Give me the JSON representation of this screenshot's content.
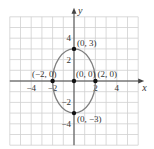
{
  "chart_data": {
    "type": "scatter",
    "title": "",
    "xlabel": "x",
    "ylabel": "y",
    "xlim": [
      -6,
      6
    ],
    "ylim": [
      -6,
      6
    ],
    "grid": true,
    "x_ticks": [
      -4,
      -2,
      2,
      4
    ],
    "y_ticks": [
      -4,
      -2,
      2,
      4
    ],
    "x_tick_labels": [
      "−4",
      "−2",
      "2",
      "4"
    ],
    "y_tick_labels": [
      "−4",
      "−2",
      "2",
      "4"
    ],
    "curve": {
      "shape": "ellipse",
      "center": [
        0,
        0
      ],
      "semi_axis_x": 2,
      "semi_axis_y": 3,
      "color": "#808080"
    },
    "points": [
      {
        "x": 0,
        "y": 3,
        "label": "(0, 3)"
      },
      {
        "x": -2,
        "y": 0,
        "label": "(−2, 0)"
      },
      {
        "x": 0,
        "y": 0,
        "label": "(0, 0)"
      },
      {
        "x": 2,
        "y": 0,
        "label": "(2, 0)"
      },
      {
        "x": 0,
        "y": -3,
        "label": "(0, −3)"
      }
    ],
    "colors": {
      "grid": "#d0d0d0",
      "axis": "#444444",
      "point": "#111111",
      "text": "#333333"
    }
  }
}
